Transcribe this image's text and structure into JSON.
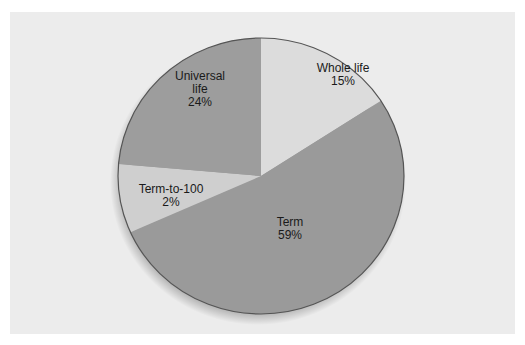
{
  "chart_data": {
    "type": "pie",
    "title": "",
    "categories": [
      "Whole life",
      "Term",
      "Term-to-100",
      "Universal life"
    ],
    "values": [
      15,
      59,
      2,
      24
    ],
    "unit": "%",
    "labels": [
      {
        "name": "Whole life",
        "value": "15%"
      },
      {
        "name": "Term",
        "value": "59%"
      },
      {
        "name": "Term-to-100",
        "value": "2%"
      },
      {
        "name": "Universal life",
        "value": "24%"
      }
    ],
    "colors": {
      "Whole life": "#dcdcdc",
      "Term": "#9a9a9a",
      "Term-to-100": "#cfcfcf",
      "Universal life": "#9d9d9d"
    },
    "legend": "none (labels placed inside slices)",
    "drawn_angles_deg_clockwise_from_top": {
      "Whole life": [
        0,
        57
      ],
      "Term": [
        57,
        246
      ],
      "Term-to-100": [
        246,
        275
      ],
      "Universal life": [
        275,
        360
      ]
    }
  },
  "slices": {
    "whole_life": {
      "name": "Whole life",
      "pct": "15%"
    },
    "term": {
      "name": "Term",
      "pct": "59%"
    },
    "term_to_100": {
      "name": "Term-to-100",
      "pct": "2%"
    },
    "universal_life": {
      "name_line1": "Universal",
      "name_line2": "life",
      "pct": "24%"
    }
  }
}
